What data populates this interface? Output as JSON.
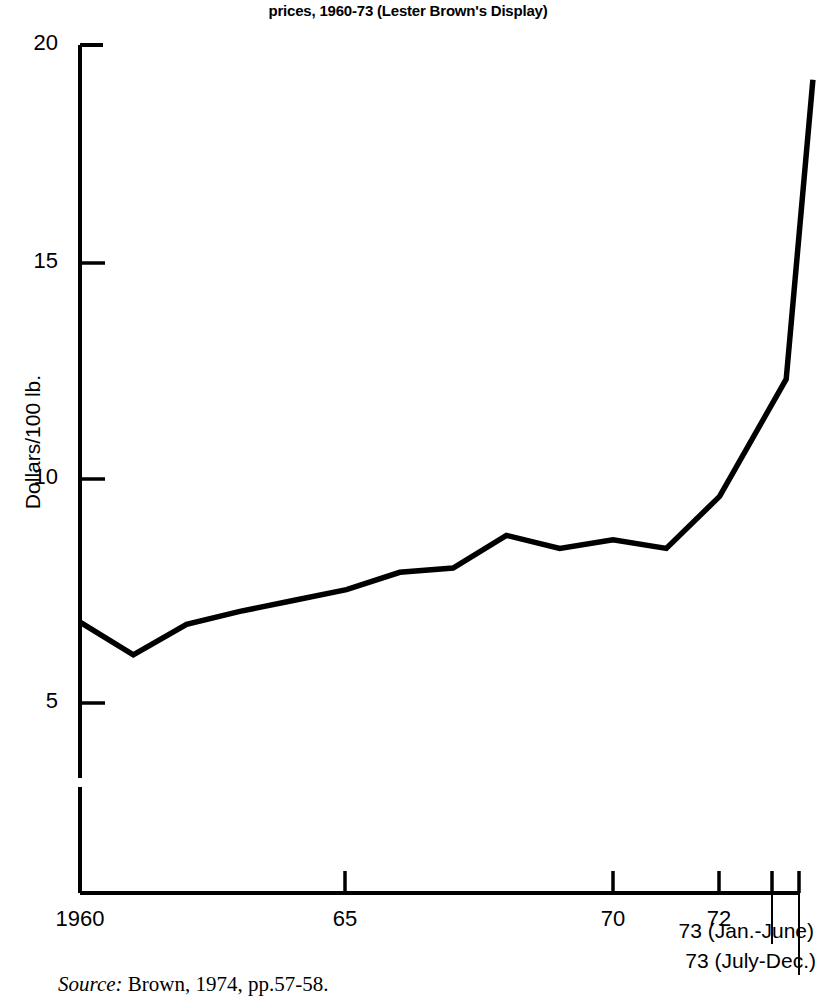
{
  "figure": {
    "title_lines": [
      "Figure. World soybean",
      "prices, 1960-73 (Lester Brown's Display)"
    ],
    "source_prefix": "Source:",
    "source_text": " Brown, 1974, pp.57-58."
  },
  "axes": {
    "y_title": "Dollars/100 lb.",
    "y_ticks": [
      "20",
      "15",
      "10",
      "5"
    ],
    "x_ticks": [
      "1960",
      "65",
      "70",
      "72"
    ],
    "x_callouts": [
      "73 (Jan.-June)",
      "73 (July-Dec.)"
    ]
  },
  "colors": {
    "line": "#000000",
    "axis": "#000000",
    "background": "#ffffff"
  },
  "chart_data": {
    "type": "line",
    "title": "Figure. World soybean prices, 1960-73 (Lester Brown's Display)",
    "xlabel": "",
    "ylabel": "Dollars/100 lb.",
    "ylim": [
      0,
      20
    ],
    "xlim": [
      1960,
      1973.75
    ],
    "grid": false,
    "legend": "none",
    "y_tick_values": [
      20,
      15,
      10,
      5
    ],
    "x_tick_values": [
      1960,
      1965,
      1970,
      1972,
      1973.25,
      1973.75
    ],
    "x_tick_labels": [
      "1960",
      "65",
      "70",
      "72",
      "73 (Jan.-June)",
      "73 (July-Dec.)"
    ],
    "axis_break_y_axis": true,
    "series": [
      {
        "name": "World soybean price",
        "x": [
          1960,
          1961,
          1962,
          1963,
          1964,
          1965,
          1966,
          1967,
          1968,
          1969,
          1970,
          1971,
          1972,
          1973.25,
          1973.75
        ],
        "values": [
          6.7,
          5.95,
          6.65,
          6.95,
          7.2,
          7.45,
          7.85,
          7.95,
          8.7,
          8.4,
          8.6,
          8.4,
          9.6,
          12.3,
          19.2
        ]
      }
    ]
  }
}
